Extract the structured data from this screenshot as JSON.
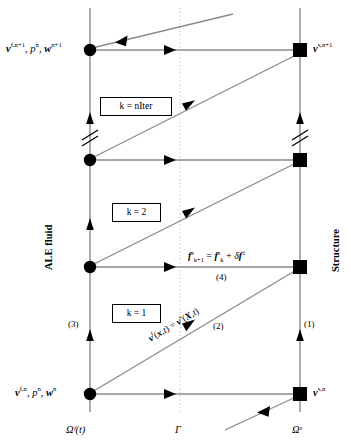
{
  "figure": {
    "type": "sequence-timeline-diagram"
  },
  "columns": {
    "fluid": {
      "axis_label": "ALE fluid",
      "domain_label": "Ωᶠ(t)",
      "x": 90
    },
    "interface": {
      "domain_label": "Γ",
      "x": 180
    },
    "structure": {
      "axis_label": "Structure",
      "domain_label": "Ωˢ",
      "x": 300
    }
  },
  "states": {
    "fluid_top": {
      "text": "vᶠ,ⁿ⁺¹, pⁿ, wⁿ⁺¹",
      "parts": [
        {
          "sym": "v",
          "sup": "f,n+1",
          "bold": true
        },
        {
          "sym": "p",
          "sup": "n",
          "bold": false
        },
        {
          "sym": "w",
          "sup": "n+1",
          "bold": true
        }
      ]
    },
    "structure_top": {
      "parts": [
        {
          "sym": "v",
          "sup": "s,n+1",
          "bold": true
        }
      ]
    },
    "fluid_bottom": {
      "parts": [
        {
          "sym": "v",
          "sup": "f,n",
          "bold": true
        },
        {
          "sym": "p",
          "sup": "n",
          "bold": false
        },
        {
          "sym": "w",
          "sup": "n",
          "bold": true
        }
      ]
    },
    "structure_bottom": {
      "parts": [
        {
          "sym": "v",
          "sup": "s,n",
          "bold": true
        }
      ]
    }
  },
  "iteration_boxes": [
    {
      "id": "k-niter",
      "label": "k = nIter",
      "x": 100,
      "y": 97,
      "w": 72,
      "h": 19
    },
    {
      "id": "k-2",
      "label": "k = 2",
      "x": 112,
      "y": 203,
      "w": 49,
      "h": 19
    },
    {
      "id": "k-1",
      "label": "k = 1",
      "x": 112,
      "y": 304,
      "w": 49,
      "h": 19
    }
  ],
  "equations": {
    "force_update": {
      "latex": "f^s_{k+1} = f^s_k + δf^1",
      "number": "(4)"
    },
    "velocity_continuity": {
      "latex": "vᶠ(x,t) = vˢ(X,t)",
      "number": "(2)"
    }
  },
  "step_numbers": {
    "one": "(1)",
    "two": "(2)",
    "three": "(3)",
    "four": "(4)"
  },
  "colors": {
    "line": "#808080",
    "node": "#000000",
    "interface_dotted": "#cccccc",
    "text": "#000000",
    "background": "#ffffff"
  },
  "nodes": {
    "fluid_y": [
      50,
      160,
      267,
      394
    ],
    "structure_y": [
      50,
      160,
      267,
      394
    ],
    "fluid_marker": "filled-circle",
    "structure_marker": "filled-square"
  }
}
